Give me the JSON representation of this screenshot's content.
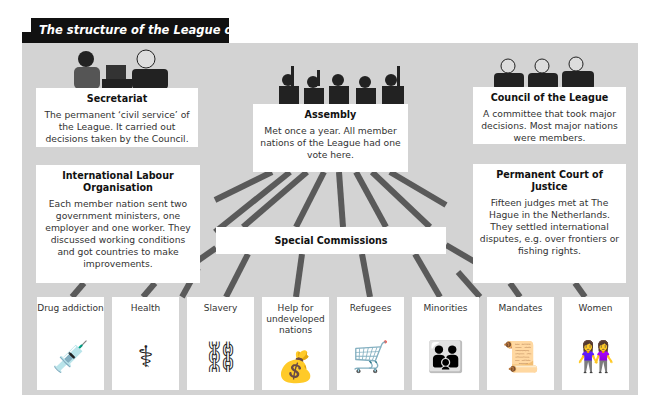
{
  "title": "The structure of the League of Nations.",
  "colors": {
    "panel": "#d3d3d3",
    "title_bg": "#111111",
    "connector": "#555555"
  },
  "bodies": {
    "secretariat": {
      "heading": "Secretariat",
      "text": "The permanent ‘civil service’ of the League. It carried out decisions taken by the Council.",
      "illustration": "secretary-typing-icon"
    },
    "assembly": {
      "heading": "Assembly",
      "text": "Met once a year. All member nations of the League had one vote here.",
      "illustration": "delegates-voting-icon"
    },
    "council": {
      "heading": "Council of the League",
      "text": "A committee that took major decisions. Most major nations were members.",
      "illustration": "council-men-icon"
    },
    "ilo": {
      "heading": "International Labour Organisation",
      "text": "Each member nation sent two government ministers, one employer and one worker. They discussed working conditions and got countries to make improvements."
    },
    "court": {
      "heading": "Permanent Court of Justice",
      "text": "Fifteen judges met at The Hague in the Netherlands. They settled international disputes, e.g. over frontiers or fishing rights."
    },
    "special": {
      "heading": "Special Commissions"
    }
  },
  "commissions": [
    {
      "label": "Drug addiction",
      "icon": "💉",
      "icon_name": "syringe-pills-icon"
    },
    {
      "label": "Health",
      "icon": "⚕",
      "icon_name": "stethoscope-icon"
    },
    {
      "label": "Slavery",
      "icon": "⛓",
      "icon_name": "chains-icon"
    },
    {
      "label": "Help for undeveloped nations",
      "icon": "💰",
      "icon_name": "money-bag-icon"
    },
    {
      "label": "Refugees",
      "icon": "🛒",
      "icon_name": "refugee-cart-icon"
    },
    {
      "label": "Minorities",
      "icon": "👪",
      "icon_name": "family-icon"
    },
    {
      "label": "Mandates",
      "icon": "📜",
      "icon_name": "scroll-icon"
    },
    {
      "label": "Women",
      "icon": "👭",
      "icon_name": "women-icon"
    }
  ]
}
